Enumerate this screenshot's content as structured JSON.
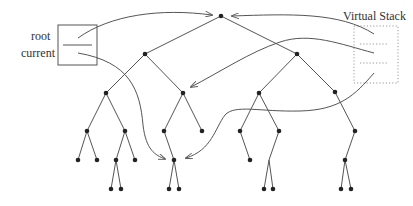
{
  "diagram": {
    "labels": {
      "root": "root",
      "current": "current",
      "virtual_stack": "Virtual Stack"
    },
    "colors": {
      "line": "#555555",
      "node": "#222222",
      "dotted": "#999999",
      "text": "#333333"
    },
    "pointer_box": {
      "x": 58,
      "y": 25,
      "w": 39,
      "h": 40,
      "divider_y": 45
    },
    "stack_box": {
      "x": 354,
      "y": 26,
      "w": 44,
      "h": 57,
      "dividers_y": [
        44,
        63
      ]
    },
    "tree": {
      "nodes": [
        {
          "id": "n0",
          "x": 221,
          "y": 16
        },
        {
          "id": "n1",
          "x": 145,
          "y": 54
        },
        {
          "id": "n2",
          "x": 297,
          "y": 54
        },
        {
          "id": "n3",
          "x": 106,
          "y": 93
        },
        {
          "id": "n4",
          "x": 183,
          "y": 93
        },
        {
          "id": "n5",
          "x": 259,
          "y": 93
        },
        {
          "id": "n6",
          "x": 335,
          "y": 92
        },
        {
          "id": "n7",
          "x": 87,
          "y": 131
        },
        {
          "id": "n8",
          "x": 125,
          "y": 131
        },
        {
          "id": "n9",
          "x": 164,
          "y": 131
        },
        {
          "id": "n10",
          "x": 202,
          "y": 131
        },
        {
          "id": "n11",
          "x": 240,
          "y": 131
        },
        {
          "id": "n12",
          "x": 279,
          "y": 131
        },
        {
          "id": "n13",
          "x": 355,
          "y": 131
        },
        {
          "id": "n14",
          "x": 78,
          "y": 160
        },
        {
          "id": "n15",
          "x": 97,
          "y": 160
        },
        {
          "id": "n16",
          "x": 116,
          "y": 160
        },
        {
          "id": "n17",
          "x": 135,
          "y": 160
        },
        {
          "id": "n18",
          "x": 174,
          "y": 160
        },
        {
          "id": "n19",
          "x": 250,
          "y": 160
        },
        {
          "id": "n20",
          "x": 345,
          "y": 160
        },
        {
          "id": "n21",
          "x": 111,
          "y": 189
        },
        {
          "id": "n22",
          "x": 121,
          "y": 189
        },
        {
          "id": "n23",
          "x": 169,
          "y": 189
        },
        {
          "id": "n24",
          "x": 179,
          "y": 189
        },
        {
          "id": "n25",
          "x": 264,
          "y": 189
        },
        {
          "id": "n26",
          "x": 273,
          "y": 189
        },
        {
          "id": "n27",
          "x": 341,
          "y": 189
        },
        {
          "id": "n28",
          "x": 351,
          "y": 189
        }
      ],
      "edges": [
        [
          "n0",
          "n1"
        ],
        [
          "n0",
          "n2"
        ],
        [
          "n1",
          "n3"
        ],
        [
          "n1",
          "n4"
        ],
        [
          "n2",
          "n5"
        ],
        [
          "n2",
          "n6"
        ],
        [
          "n3",
          "n7"
        ],
        [
          "n3",
          "n8"
        ],
        [
          "n4",
          "n9"
        ],
        [
          "n4",
          "n10"
        ],
        [
          "n5",
          "n11"
        ],
        [
          "n5",
          "n12"
        ],
        [
          "n6",
          "n13"
        ],
        [
          "n7",
          "n14"
        ],
        [
          "n7",
          "n15"
        ],
        [
          "n8",
          "n16"
        ],
        [
          "n8",
          "n17"
        ],
        [
          "n9",
          "n18"
        ],
        [
          "n11",
          "n19"
        ],
        [
          "n13",
          "n20"
        ],
        [
          "n16",
          "n21"
        ],
        [
          "n16",
          "n22"
        ],
        [
          "n18",
          "n23"
        ],
        [
          "n18",
          "n24"
        ],
        [
          "n20",
          "n27"
        ],
        [
          "n20",
          "n28"
        ]
      ],
      "branch_edges": [
        {
          "from": [
            279,
            131
          ],
          "via": [
            269,
            160
          ],
          "to": [
            [
              264,
              189
            ],
            [
              273,
              189
            ]
          ]
        }
      ]
    },
    "pointers": [
      {
        "name": "root-pointer",
        "path": "M78,38 C110,15 160,8 212,15",
        "arrow_at": [
          214,
          16
        ],
        "arrow_dir": "right"
      },
      {
        "name": "current-pointer",
        "path": "M78,53 C130,62 140,90 143,125 C146,150 155,155 165,159",
        "arrow_at": [
          167,
          160
        ],
        "arrow_dir": "right"
      },
      {
        "name": "stack-entry-1",
        "path": "M374,34 C340,12 290,14 232,16",
        "arrow_at": [
          230,
          16
        ],
        "arrow_dir": "left"
      },
      {
        "name": "stack-entry-2",
        "path": "M374,53 C340,44 310,32 280,42 C250,52 220,72 191,87",
        "arrow_at": [
          188,
          88
        ],
        "arrow_dir": "down-left"
      },
      {
        "name": "stack-entry-3",
        "path": "M374,73 C355,95 340,110 300,111 C260,112 235,104 225,115 C215,128 212,150 186,158",
        "arrow_at": [
          183,
          160
        ],
        "arrow_dir": "left"
      }
    ]
  }
}
